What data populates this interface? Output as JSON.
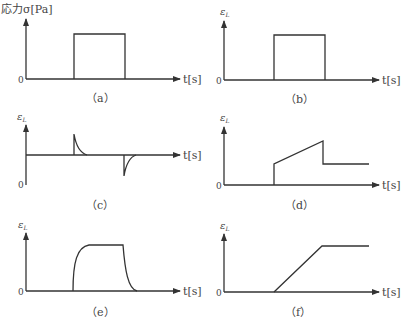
{
  "title_ylabel_a": "応力σ[Pa]",
  "ylabel_strain": "ε",
  "ylabel_strain_sub": "L",
  "xlabel": "t[s]",
  "origin_label": "0",
  "panels": [
    {
      "id": "a",
      "caption": "（a）",
      "description": "Applied stress: rectangular step pulse"
    },
    {
      "id": "b",
      "caption": "（b）",
      "description": "Strain: rectangular pulse (elastic response)"
    },
    {
      "id": "c",
      "caption": "（c）",
      "description": "Strain: decaying spikes up at load, down at unload"
    },
    {
      "id": "d",
      "caption": "（d）",
      "description": "Strain: instant jump, linear creep, instant drop to permanent set"
    },
    {
      "id": "e",
      "caption": "（e）",
      "description": "Strain: exponential rise to plateau, exponential decay to zero"
    },
    {
      "id": "f",
      "caption": "（f）",
      "description": "Strain: linear ramp then constant (viscous flow)"
    }
  ],
  "colors": {
    "line": "#333333",
    "text": "#444444"
  }
}
